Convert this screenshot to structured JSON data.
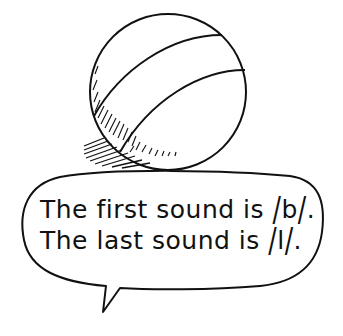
{
  "illustration": {
    "subject": "ball",
    "icons": [
      "ball-illustration",
      "speech-bubble"
    ]
  },
  "speech_bubble": {
    "lines": [
      {
        "prefix": "The first sound is ",
        "phoneme": "b",
        "suffix": "."
      },
      {
        "prefix": "The last sound is ",
        "phoneme": "l",
        "suffix": "."
      }
    ]
  }
}
